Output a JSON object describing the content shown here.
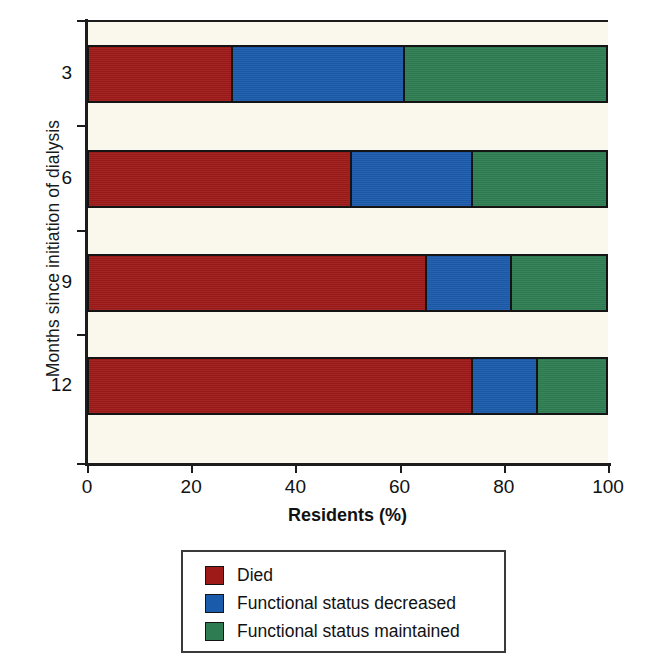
{
  "chart_data": {
    "type": "bar",
    "orientation": "horizontal",
    "stacked": true,
    "normalized": true,
    "title": "",
    "xlabel": "Residents (%)",
    "ylabel": "Months since initiation of dialysis",
    "xlim": [
      0,
      100
    ],
    "xticks": [
      0,
      20,
      40,
      60,
      80,
      100
    ],
    "xtick_labels": [
      "0",
      "20",
      "40",
      "60",
      "80",
      "100"
    ],
    "categories": [
      "3",
      "6",
      "9",
      "12"
    ],
    "ytick_labels": [
      "3",
      "6",
      "9",
      "12"
    ],
    "grid": false,
    "legend_position": "bottom-center",
    "series": [
      {
        "name": "Died",
        "color": "#9d1a18",
        "values": [
          27.8,
          50.9,
          65.3,
          74.3
        ]
      },
      {
        "name": "Functional status decreased",
        "color": "#1b5bab",
        "values": [
          33.4,
          23.4,
          16.5,
          12.5
        ]
      },
      {
        "name": "Functional status maintained",
        "color": "#2e7d52",
        "values": [
          38.8,
          25.7,
          18.2,
          13.2
        ]
      }
    ],
    "cumulative_boundaries": [
      [
        27.8,
        61.2
      ],
      [
        50.9,
        74.3
      ],
      [
        65.3,
        81.8
      ],
      [
        74.3,
        86.8
      ]
    ]
  },
  "legend": {
    "items": [
      {
        "label": "Died",
        "color": "#9d1a18"
      },
      {
        "label": "Functional status decreased",
        "color": "#1b5bab"
      },
      {
        "label": "Functional status maintained",
        "color": "#2e7d52"
      }
    ]
  },
  "colors": {
    "plot_background": "#faf7ec",
    "page_background": "#ffffff",
    "axis": "#1c1c1c",
    "died": "#9d1a18",
    "decreased": "#1b5bab",
    "maintained": "#2e7d52"
  }
}
